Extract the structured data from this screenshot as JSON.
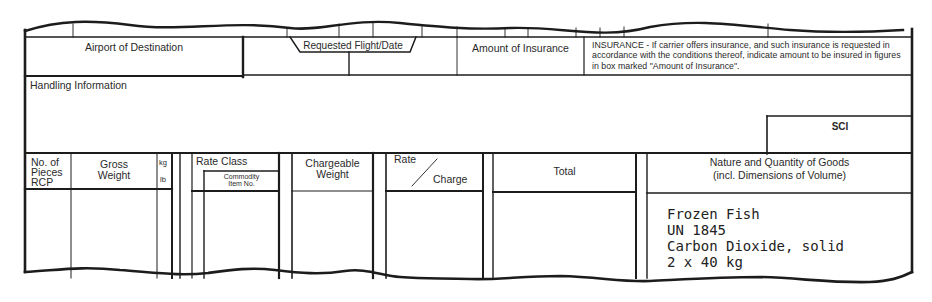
{
  "form": {
    "type": "Air Waybill section",
    "header_row": {
      "airport_of_destination": "Airport of Destination",
      "requested_flight_date": "Requested Flight/Date",
      "amount_of_insurance": "Amount of Insurance",
      "insurance_note": "INSURANCE - If carrier offers insurance, and such insurance is requested in accordance with the conditions thereof, indicate amount to be insured in figures in box marked \"Amount of Insurance\"."
    },
    "handling": {
      "label": "Handling Information",
      "sci_label": "SCI"
    },
    "columns": {
      "pieces": "No. of\nPieces\nRCP",
      "gross_weight": "Gross\nWeight",
      "kg": "kg",
      "lb": "lb",
      "rate_class": "Rate Class",
      "commodity_item": "Commodity\nItem No.",
      "chargeable_weight": "Chargeable\nWeight",
      "rate": "Rate",
      "charge": "Charge",
      "total": "Total",
      "nature_quantity": "Nature and Quantity of Goods",
      "nature_quantity_sub": "(incl. Dimensions of Volume)"
    },
    "goods_entry": {
      "line1": "Frozen Fish",
      "line2": "UN 1845",
      "line3": "Carbon Dioxide, solid",
      "line4": "2 x 40 kg"
    }
  }
}
